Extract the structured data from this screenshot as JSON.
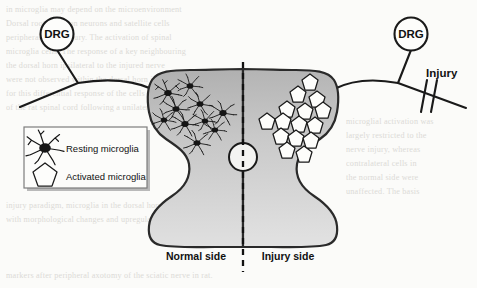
{
  "figure": {
    "background_color": "#fbfbf9",
    "ink_color": "#1a1a1a"
  },
  "labels": {
    "drg_left": "DRG",
    "drg_right": "DRG",
    "injury": "Injury",
    "normal_side": "Normal side",
    "injury_side": "Injury side"
  },
  "legend": {
    "items": [
      {
        "icon": "resting-microglia-icon",
        "label": "Resting microglia"
      },
      {
        "icon": "activated-microglia-icon",
        "label": "Activated microglia"
      }
    ]
  },
  "diagram_data": {
    "type": "schematic",
    "structure": "spinal-cord-transverse-section",
    "midline_style": "dashed-vertical",
    "central_canal": {
      "cx": 243,
      "cy": 157,
      "r": 14
    },
    "dorsal_root_ganglia": [
      {
        "side": "left",
        "cx": 57,
        "cy": 34,
        "r": 16,
        "label": "DRG"
      },
      {
        "side": "right",
        "cx": 411,
        "cy": 34,
        "r": 16,
        "label": "DRG"
      }
    ],
    "injury_mark": {
      "side": "right",
      "type": "double-slash-transection",
      "x": 432,
      "y": 95
    },
    "cell_populations": [
      {
        "name": "Resting microglia",
        "side": "Normal side",
        "hemisphere": "left",
        "morphology": "ramified-dark-soma-with-branching-processes",
        "count": 10,
        "positions": [
          [
            168,
            93
          ],
          [
            189,
            86
          ],
          [
            176,
            108
          ],
          [
            198,
            104
          ],
          [
            164,
            118
          ],
          [
            184,
            123
          ],
          [
            203,
            120
          ],
          [
            221,
            113
          ],
          [
            214,
            128
          ],
          [
            196,
            142
          ]
        ]
      },
      {
        "name": "Activated microglia",
        "side": "Injury side",
        "hemisphere": "right",
        "morphology": "amoeboid-pentagon-star-outline",
        "count": 15,
        "positions": [
          [
            310,
            82
          ],
          [
            298,
            95
          ],
          [
            316,
            100
          ],
          [
            287,
            110
          ],
          [
            305,
            112
          ],
          [
            322,
            111
          ],
          [
            268,
            122
          ],
          [
            283,
            122
          ],
          [
            299,
            125
          ],
          [
            314,
            126
          ],
          [
            295,
            139
          ],
          [
            310,
            141
          ],
          [
            281,
            133
          ],
          [
            305,
            155
          ],
          [
            322,
            135
          ]
        ]
      }
    ],
    "gradient": {
      "from": "#b4b4b4",
      "to": "#dedede",
      "direction": "top-to-bottom"
    }
  },
  "background_text_lines": [
    "in microglia may depend on the microenvironment",
    "Dorsal root ganglion neurons and satellite cells",
    "peripheral nerve injury. The activation of spinal",
    "microglia cells. The response of a key neighbouring",
    "the dorsal horn ipsilateral to the injured nerve",
    "were not observed within the dorsal horn in the",
    "for this differential response of the cells in the",
    "of the rat spinal cord following a unilateral",
    "microglial activation was largely restricted to",
    "the nerve injury, whereas contralateral cells",
    "normal side. The molecular basis responsible",
    "two compartments remains to be determined.",
    "injury paradigm, microglia in the dorsal horn",
    "respond rapidly with morphological changes",
    "and upregulation of surface markers after",
    "peripheral axotomy of the sciatic nerve."
  ]
}
